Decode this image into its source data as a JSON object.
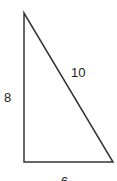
{
  "diagram": {
    "type": "right-triangle",
    "vertices": {
      "top": [
        24,
        13
      ],
      "bottom_left": [
        24,
        162
      ],
      "bottom_right": [
        113,
        162
      ]
    },
    "stroke_color": "#333333",
    "labels": {
      "vertical_side": "8",
      "horizontal_side": "6",
      "hypotenuse": "10"
    }
  }
}
